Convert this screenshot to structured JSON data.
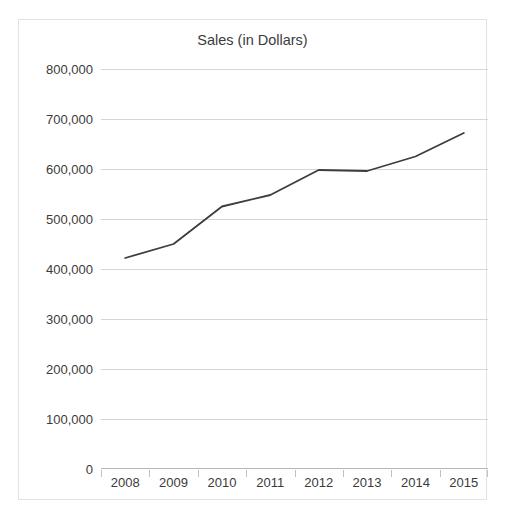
{
  "ghost_text": "",
  "chart": {
    "title": "Sales (in Dollars)"
  },
  "chart_data": {
    "type": "line",
    "title": "Sales (in Dollars)",
    "xlabel": "",
    "ylabel": "",
    "categories": [
      "2008",
      "2009",
      "2010",
      "2011",
      "2012",
      "2013",
      "2014",
      "2015"
    ],
    "values": [
      422000,
      450000,
      525000,
      548000,
      598000,
      596000,
      625000,
      672000
    ],
    "series": [
      {
        "name": "Sales",
        "values": [
          422000,
          450000,
          525000,
          548000,
          598000,
          596000,
          625000,
          672000
        ]
      }
    ],
    "ylim": [
      0,
      800000
    ],
    "ytick_values": [
      800000,
      700000,
      600000,
      500000,
      400000,
      300000,
      200000,
      100000,
      0
    ],
    "ytick_labels": [
      "800,000",
      "700,000",
      "600,000",
      "500,000",
      "400,000",
      "300,000",
      "200,000",
      "100,000",
      "0"
    ],
    "xtick_labels": [
      "2008",
      "2009",
      "2010",
      "2011",
      "2012",
      "2013",
      "2014",
      "2015"
    ],
    "grid": true,
    "legend": false,
    "line_color": "#3d3d3d",
    "grid_color": "#d6d6d8",
    "border_color": "#e2e2e4",
    "text_color": "#3b3b3b",
    "background": "#ffffff"
  }
}
